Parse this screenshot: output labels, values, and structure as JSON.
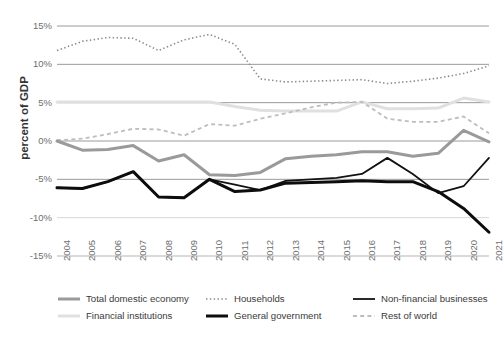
{
  "chart_data": {
    "type": "line",
    "title": "",
    "subtitle": "",
    "xlabel": "",
    "ylabel": "percent of GDP",
    "ylim": [
      -15,
      15
    ],
    "ytick_labels": [
      "15%",
      "10%",
      "5%",
      "0%",
      "-5%",
      "-10%",
      "-15%"
    ],
    "ytick_values": [
      15,
      10,
      5,
      0,
      -5,
      -10,
      -15
    ],
    "grid": true,
    "legend_position": "bottom",
    "categories": [
      2004,
      2005,
      2006,
      2007,
      2008,
      2009,
      2010,
      2011,
      2012,
      2013,
      2014,
      2015,
      2016,
      2017,
      2018,
      2019,
      2020,
      2021
    ],
    "xtick_labels": [
      "2004",
      "2005",
      "2006",
      "2007",
      "2008",
      "2009",
      "2010",
      "2011",
      "2012",
      "2013",
      "2014",
      "2015",
      "2016",
      "2017",
      "2018",
      "2019",
      "2020",
      "2021"
    ],
    "series": [
      {
        "name": "Total domestic economy",
        "style": "solid",
        "color": "#9a9a9a",
        "width": 3,
        "values": [
          0.0,
          -1.2,
          -1.1,
          -0.6,
          -2.6,
          -1.8,
          -4.4,
          -4.5,
          -4.1,
          -2.3,
          -2.0,
          -1.8,
          -1.4,
          -1.4,
          -2.0,
          -1.6,
          1.4,
          -0.1
        ]
      },
      {
        "name": "Financial institutions",
        "style": "solid",
        "color": "#e0e0e0",
        "width": 3,
        "values": [
          5.1,
          5.1,
          5.1,
          5.1,
          5.1,
          5.1,
          5.1,
          4.5,
          4.0,
          3.9,
          3.9,
          3.9,
          5.1,
          4.2,
          4.2,
          4.3,
          5.6,
          5.1
        ]
      },
      {
        "name": "Households",
        "style": "dotted",
        "color": "#8c8c8c",
        "width": 1.6,
        "values": [
          11.8,
          13.0,
          13.5,
          13.4,
          11.8,
          13.2,
          13.9,
          12.6,
          8.1,
          7.7,
          7.8,
          7.9,
          8.0,
          7.5,
          7.8,
          8.2,
          8.8,
          9.8
        ]
      },
      {
        "name": "General government",
        "style": "solid",
        "color": "#0d0d0d",
        "width": 3,
        "values": [
          -6.1,
          -6.2,
          -5.3,
          -4.0,
          -7.3,
          -7.4,
          -5.0,
          -6.6,
          -6.4,
          -5.5,
          -5.4,
          -5.3,
          -5.2,
          -5.3,
          -5.3,
          -6.6,
          -8.8,
          -11.9
        ]
      },
      {
        "name": "Non-financial businesses",
        "style": "solid",
        "color": "#121212",
        "width": 1.8,
        "values": [
          -6.1,
          -6.2,
          -5.3,
          -4.0,
          -7.3,
          -7.4,
          -5.0,
          -5.7,
          -6.4,
          -5.2,
          -5.0,
          -4.8,
          -4.3,
          -2.2,
          -4.3,
          -6.8,
          -5.9,
          -2.2
        ]
      },
      {
        "name": "Rest of world",
        "style": "dashed",
        "color": "#bdbdbd",
        "width": 1.8,
        "values": [
          0.1,
          0.3,
          0.9,
          1.6,
          1.5,
          0.7,
          2.2,
          2.0,
          2.9,
          3.6,
          4.4,
          5.0,
          5.1,
          2.9,
          2.5,
          2.5,
          3.2,
          1.0
        ]
      }
    ]
  },
  "legend": {
    "items": [
      {
        "label": "Total domestic economy",
        "series": "Total domestic economy"
      },
      {
        "label": "Financial institutions",
        "series": "Financial institutions"
      },
      {
        "label": "Households",
        "series": "Households"
      },
      {
        "label": "General government",
        "series": "General government"
      },
      {
        "label": "Non-financial businesses",
        "series": "Non-financial businesses"
      },
      {
        "label": "Rest of world",
        "series": "Rest of world"
      }
    ]
  },
  "colors": {
    "gridline": "#9a9a9a",
    "gridline_light": "#d7d7d7",
    "tick_text": "#6e6e6e",
    "axis_title": "#333333",
    "background": "#ffffff"
  }
}
